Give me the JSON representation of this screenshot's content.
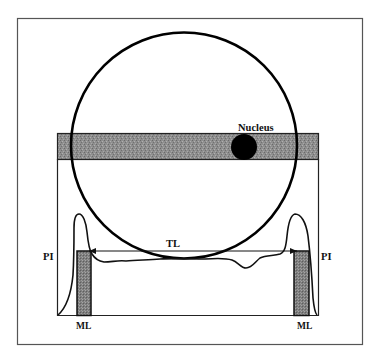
{
  "figure": {
    "labels": {
      "nucleus": "Nucleus",
      "tl": "TL",
      "pi_left": "PI",
      "pi_right": "PI",
      "ml_left": "ML",
      "ml_right": "ML"
    },
    "colors": {
      "stroke": "#111111",
      "frame": "#555555",
      "band_fill": "#8a8a8a",
      "bar_fill": "#7d7d7d",
      "nucleus_fill": "#000000",
      "background": "#ffffff"
    }
  }
}
